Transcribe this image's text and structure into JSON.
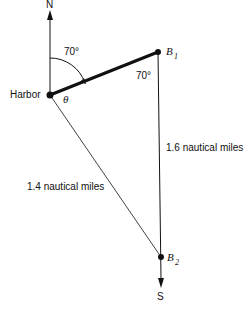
{
  "diagram": {
    "compass": {
      "north": "N",
      "south": "S"
    },
    "points": {
      "harbor": "Harbor",
      "b1": {
        "letter": "B",
        "sub": "1"
      },
      "b2": {
        "letter": "B",
        "sub": "2"
      }
    },
    "angles": {
      "bearing": "70°",
      "at_b1": "70°",
      "theta": "θ"
    },
    "distances": {
      "harbor_b2": "1.4 nautical miles",
      "b1_b2": "1.6 nautical miles"
    },
    "colors": {
      "ink": "#111111",
      "background": "#ffffff"
    }
  }
}
